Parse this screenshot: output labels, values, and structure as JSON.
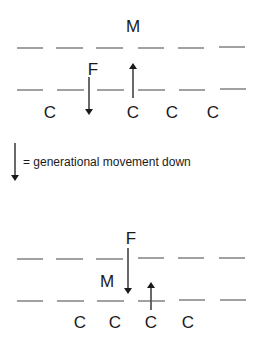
{
  "legend": {
    "symbol": "down-arrow",
    "text": "= generational movement down"
  },
  "top_diagram": {
    "labels": {
      "M": "M",
      "F": "F",
      "C1": "C",
      "C2": "C",
      "C3": "C",
      "C4": "C"
    },
    "arrows": [
      {
        "from": "F",
        "direction": "down"
      },
      {
        "from": "C2",
        "direction": "up"
      }
    ]
  },
  "bottom_diagram": {
    "labels": {
      "F": "F",
      "M": "M",
      "C1": "C",
      "C2": "C",
      "C3": "C",
      "C4": "C"
    },
    "arrows": [
      {
        "from": "F",
        "direction": "down"
      },
      {
        "from": "C3",
        "direction": "up"
      }
    ]
  },
  "colors": {
    "ink": "#1a1a1a",
    "dash": "#555555",
    "background": "#ffffff"
  }
}
